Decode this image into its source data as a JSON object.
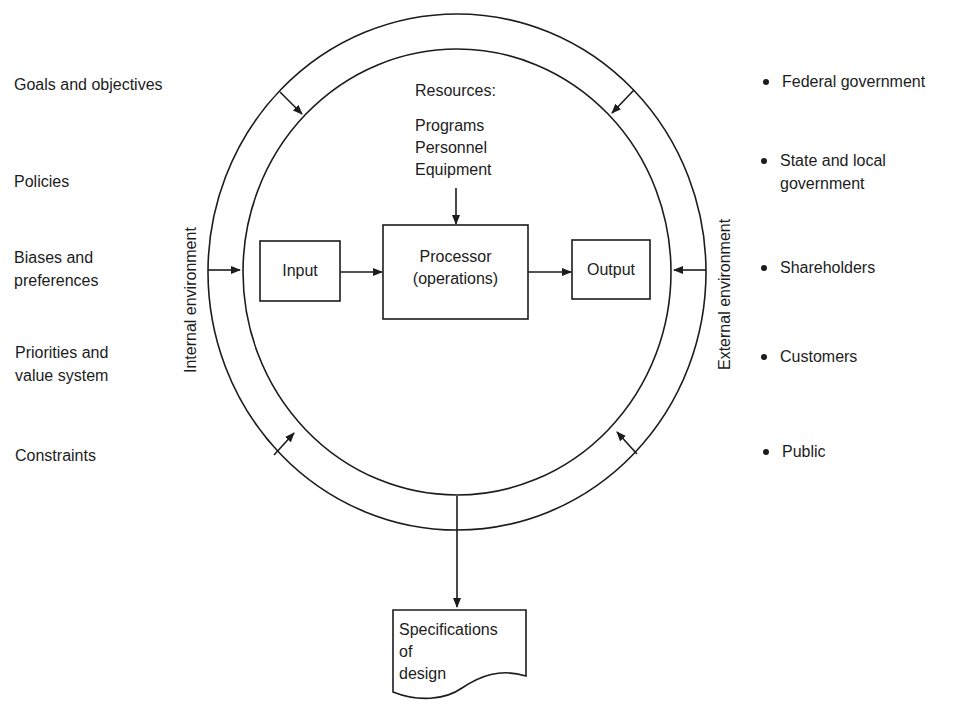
{
  "diagram": {
    "internal_environment": {
      "label": "Internal environment",
      "items": [
        {
          "line1": "Goals and objectives",
          "line2": ""
        },
        {
          "line1": "Policies",
          "line2": ""
        },
        {
          "line1": "Biases and",
          "line2": "preferences"
        },
        {
          "line1": "Priorities and",
          "line2": "value system"
        },
        {
          "line1": "Constraints",
          "line2": ""
        }
      ]
    },
    "external_environment": {
      "label": "External environment",
      "items": [
        {
          "line1": "Federal government",
          "line2": ""
        },
        {
          "line1": "State and local",
          "line2": "government"
        },
        {
          "line1": "Shareholders",
          "line2": ""
        },
        {
          "line1": "Customers",
          "line2": ""
        },
        {
          "line1": "Public",
          "line2": ""
        }
      ]
    },
    "resources": {
      "title": "Resources:",
      "items": [
        "Programs",
        "Personnel",
        "Equipment"
      ]
    },
    "process": {
      "input": "Input",
      "processor_line1": "Processor",
      "processor_line2": "(operations)",
      "output": "Output"
    },
    "result_document": {
      "line1": "Specifications",
      "line2": "of",
      "line3": "design"
    },
    "colors": {
      "stroke": "#1c1c1c",
      "background": "#ffffff"
    }
  }
}
